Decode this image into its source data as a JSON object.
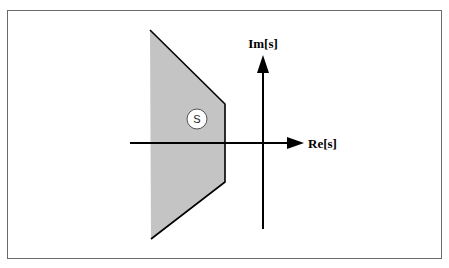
{
  "diagram": {
    "type": "s-plane region diagram",
    "axes": {
      "real_label": "Re[s]",
      "imag_label": "Im[s]"
    },
    "region": {
      "label": "S",
      "fill_color": "#c4c4c4"
    },
    "colors": {
      "frame": "#666666",
      "axis": "#000000",
      "background": "#ffffff"
    }
  }
}
